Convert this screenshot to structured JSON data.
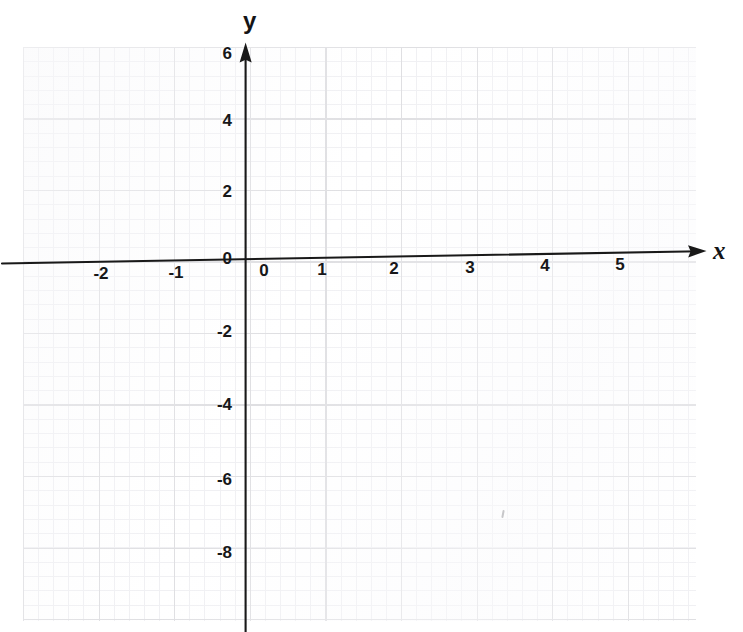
{
  "figure": {
    "paper_color": "#ffffff",
    "ink_color": "#141416",
    "grid_major_color": "#dedee2",
    "grid_minor_color": "#f0f0f3"
  },
  "axis_labels": {
    "x": "x",
    "y": "y"
  },
  "x_ticks": [
    {
      "label": "-2",
      "value": -2,
      "px": 101
    },
    {
      "label": "-1",
      "value": -1,
      "px": 176
    },
    {
      "label": "0",
      "value": 0,
      "px": 264
    },
    {
      "label": "1",
      "value": 1,
      "px": 322
    },
    {
      "label": "2",
      "value": 2,
      "px": 394
    },
    {
      "label": "3",
      "value": 3,
      "px": 470
    },
    {
      "label": "4",
      "value": 4,
      "px": 545
    },
    {
      "label": "5",
      "value": 5,
      "px": 620
    }
  ],
  "y_ticks": [
    {
      "label": "6",
      "value": 6,
      "px": 53
    },
    {
      "label": "4",
      "value": 4,
      "px": 120
    },
    {
      "label": "2",
      "value": 2,
      "px": 191
    },
    {
      "label": "0",
      "value": 0,
      "px": 258
    },
    {
      "label": "-2",
      "value": -2,
      "px": 331
    },
    {
      "label": "-4",
      "value": -4,
      "px": 404
    },
    {
      "label": "-6",
      "value": -6,
      "px": 479
    },
    {
      "label": "-8",
      "value": -8,
      "px": 552
    }
  ],
  "chart_data": {
    "type": "scatter",
    "title": "",
    "subtitle": "",
    "xlabel": "x",
    "ylabel": "y",
    "series": [
      {
        "name": "",
        "x": [],
        "y": []
      }
    ],
    "annotations": [],
    "legend": null,
    "legend_position": "none",
    "grid": true,
    "grid_style": "graph paper, major squares with 5 minor subdivisions",
    "xlim": [
      -2.9,
      5.9
    ],
    "ylim": [
      -9.2,
      6.5
    ],
    "x_tick_values": [
      -2,
      -1,
      0,
      1,
      2,
      3,
      4,
      5
    ],
    "x_tick_labels": [
      "-2",
      "-1",
      "0",
      "1",
      "2",
      "3",
      "4",
      "5"
    ],
    "y_tick_values": [
      6,
      4,
      2,
      0,
      -2,
      -4,
      -6,
      -8
    ],
    "y_tick_labels": [
      "6",
      "4",
      "2",
      "0",
      "-2",
      "-4",
      "-6",
      "-8"
    ],
    "x_tick_step": 1,
    "y_tick_step": 2,
    "axis_style": "arrowheads on positive x and positive y ends",
    "note": "Empty coordinate plane; no data plotted"
  }
}
